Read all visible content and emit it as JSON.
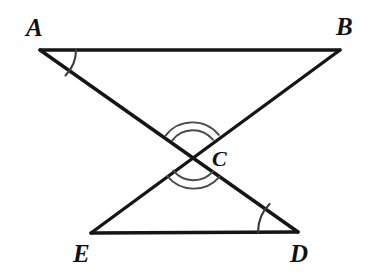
{
  "figure": {
    "background_color": "#ffffff",
    "line_color": "#151515",
    "arc_color": "#3a3a3a",
    "label_color": "#111111",
    "width": 365,
    "height": 276
  },
  "vertices": [
    {
      "id": "A",
      "label": "A",
      "x": 40,
      "y": 50,
      "label_x": 26,
      "label_y": 36
    },
    {
      "id": "B",
      "label": "B",
      "x": 340,
      "y": 50,
      "label_x": 336,
      "label_y": 35
    },
    {
      "id": "C",
      "label": "C",
      "x": 193,
      "y": 155,
      "label_x": 212,
      "label_y": 166
    },
    {
      "id": "E",
      "label": "E",
      "x": 91,
      "y": 233,
      "label_x": 73,
      "label_y": 262
    },
    {
      "id": "D",
      "label": "D",
      "x": 298,
      "y": 232,
      "label_x": 290,
      "label_y": 262
    }
  ],
  "segments": [
    {
      "name": "segment-AB",
      "from": "A",
      "to": "B"
    },
    {
      "name": "segment-ED",
      "from": "E",
      "to": "D"
    },
    {
      "name": "segment-AD",
      "from": "A",
      "to": "D"
    },
    {
      "name": "segment-BE",
      "from": "B",
      "to": "E"
    }
  ],
  "angle_marks": [
    {
      "name": "angle-mark-A",
      "vertex": "A",
      "arcs": 1,
      "description": "single arc at A between AB and AD"
    },
    {
      "name": "angle-mark-D",
      "vertex": "D",
      "arcs": 1,
      "description": "single arc at D between DE and DA"
    },
    {
      "name": "angle-mark-C-top",
      "vertex": "C",
      "arcs": 2,
      "description": "double arc on upper vertical angle ACB"
    },
    {
      "name": "angle-mark-C-bottom",
      "vertex": "C",
      "arcs": 2,
      "description": "double arc on lower vertical angle ECD"
    }
  ],
  "labels": {
    "A": "A",
    "B": "B",
    "C": "C",
    "D": "D",
    "E": "E"
  }
}
